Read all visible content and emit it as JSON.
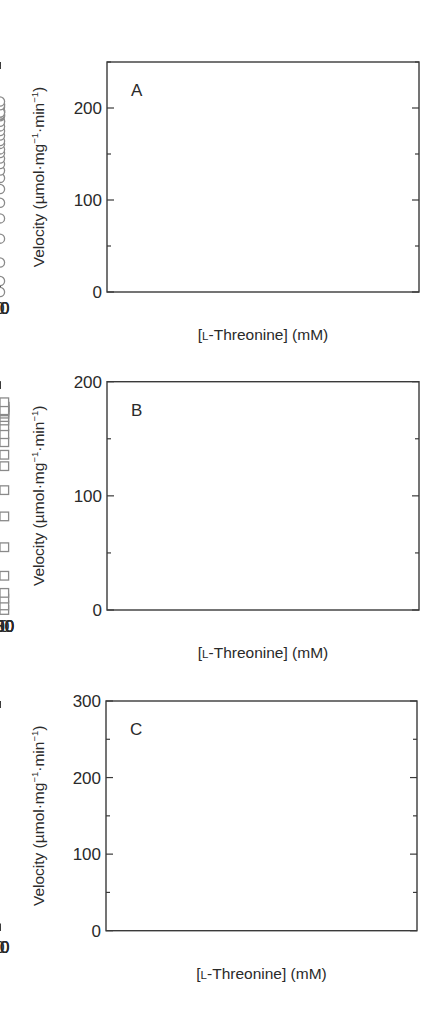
{
  "figure": {
    "marker_stroke_color": "#8a8a8a",
    "fit_line_color": "#7a7a7a",
    "axis_color": "#3a3a3a"
  },
  "chart_data": [
    {
      "type": "scatter",
      "panel_label": "A",
      "title": "",
      "xlabel": "[L-Threonine] (mM)",
      "xlabel_parts": {
        "open": "[",
        "smallcaps": "L",
        "rest": "-Threonine] (mM)"
      },
      "ylabel": "Velocity (µmol·mg⁻¹·min⁻¹)",
      "ylabel_parts": {
        "pre": "Velocity (µmol·mg",
        "sup1": "−1",
        "mid": "·min",
        "sup2": "−1",
        "post": ")"
      },
      "marker": "circle",
      "xlim": [
        0,
        60
      ],
      "ylim": [
        0,
        250
      ],
      "frame_px": {
        "left": 107,
        "top": 62,
        "right": 419,
        "bottom": 292,
        "x0": 107,
        "x_at_ref": 392,
        "x_ref": 60
      },
      "x_major_ticks": [
        0,
        20,
        40,
        60
      ],
      "x_minor_ticks": [
        10,
        30,
        50
      ],
      "y_major_ticks": [
        0,
        100,
        200
      ],
      "y_minor_ticks": [
        50,
        150,
        250
      ],
      "x": [
        0.5,
        2.9,
        4.2,
        5.3,
        6.6,
        7.6,
        8.6,
        9.5,
        10.5,
        11.4,
        12.4,
        13.4,
        14.4,
        16.1,
        18.2,
        19.2,
        20.8,
        22.8,
        24.8,
        27.6,
        30.6,
        33.6,
        36.6,
        39.2,
        40.9,
        42.7,
        45.7,
        48.9,
        50.8,
        51.7,
        54.9,
        60.8
      ],
      "y": [
        0,
        12,
        32,
        58,
        80,
        97,
        112,
        124,
        132,
        139,
        145,
        151,
        155,
        161,
        164,
        170,
        175,
        180,
        186,
        185,
        191,
        192,
        193,
        196,
        197,
        195,
        197,
        201,
        204,
        195,
        203,
        207
      ],
      "fit": {
        "x": [
          0,
          1.5,
          3,
          4,
          5,
          6,
          7,
          8,
          9,
          10,
          12,
          14,
          16,
          18,
          20,
          24,
          28,
          32,
          36,
          40,
          45,
          50,
          55,
          62.5
        ],
        "y": [
          0,
          3,
          14,
          28,
          46,
          66,
          83,
          98,
          110,
          120,
          136,
          148,
          157,
          164,
          170,
          179,
          185,
          189,
          192,
          195,
          197,
          199,
          201,
          203
        ]
      }
    },
    {
      "type": "scatter",
      "panel_label": "B",
      "title": "",
      "xlabel": "[L-Threonine] (mM)",
      "xlabel_parts": {
        "open": "[",
        "smallcaps": "L",
        "rest": "-Threonine] (mM)"
      },
      "ylabel": "Velocity (µmol·mg⁻¹·min⁻¹)",
      "ylabel_parts": {
        "pre": "Velocity (µmol·mg",
        "sup1": "−1",
        "mid": "·min",
        "sup2": "−1",
        "post": ")"
      },
      "marker": "square",
      "xlim": [
        0,
        277
      ],
      "ylim": [
        0,
        200
      ],
      "frame_px": {
        "left": 107,
        "top": 381.7,
        "right": 419,
        "bottom": 610,
        "x0": 107.3,
        "x_at_ref": 388.7,
        "x_ref": 250
      },
      "x_major_ticks": [
        0,
        50,
        100,
        150,
        200,
        250
      ],
      "x_minor_ticks": [
        25,
        75,
        125,
        175,
        225
      ],
      "y_major_ticks": [
        0,
        100,
        200
      ],
      "y_minor_ticks": [
        50,
        150
      ],
      "x": [
        10,
        20,
        30,
        40,
        50,
        60,
        70,
        80,
        90,
        100,
        110,
        120,
        130,
        140,
        150,
        157,
        167,
        177,
        188,
        198,
        208,
        219,
        230,
        240,
        261
      ],
      "y": [
        0,
        4,
        10,
        15,
        30,
        55,
        82,
        105,
        126,
        136,
        147,
        154,
        161,
        166,
        169,
        172,
        174,
        176,
        178,
        175,
        178,
        178,
        178,
        175,
        182
      ],
      "fit": {
        "x": [
          10,
          20,
          30,
          40,
          45,
          50,
          55,
          60,
          65,
          70,
          75,
          80,
          85,
          90,
          100,
          110,
          120,
          130,
          140,
          150,
          170,
          190,
          210,
          230,
          250,
          268
        ],
        "y": [
          0,
          2,
          6,
          13,
          19,
          27,
          40,
          54,
          68,
          82,
          94,
          105,
          115,
          123,
          136,
          146,
          154,
          160,
          165,
          169,
          174,
          177,
          178,
          179,
          180,
          180
        ]
      }
    },
    {
      "type": "scatter",
      "panel_label": "C",
      "title": "",
      "xlabel": "[L-Threonine] (mM)",
      "xlabel_parts": {
        "open": "[",
        "smallcaps": "L",
        "rest": "-Threonine] (mM)"
      },
      "ylabel": "Velocity (µmol·mg⁻¹·min⁻¹)",
      "ylabel_parts": {
        "pre": "Velocity (µmol·mg",
        "sup1": "−1",
        "mid": "·min",
        "sup2": "−1",
        "post": ")"
      },
      "marker": "triangle",
      "xlim": [
        0,
        65.5
      ],
      "ylim": [
        0,
        300
      ],
      "frame_px": {
        "left": 106,
        "top": 701,
        "right": 417,
        "bottom": 930.7,
        "x0": 106,
        "x_at_ref": 391,
        "x_ref": 60
      },
      "x_major_ticks": [
        0,
        20,
        40,
        60
      ],
      "x_minor_ticks": [
        10,
        30,
        50
      ],
      "y_major_ticks": [
        0,
        100,
        200,
        300
      ],
      "y_minor_ticks": [
        50,
        150,
        250
      ],
      "x": [
        0.4,
        1.0,
        1.7,
        2.4,
        3.1,
        3.8,
        4.5,
        5.2,
        6.1,
        7.2,
        8.3,
        9.4,
        10.9,
        12.3,
        14.3,
        16.5,
        18.4,
        20.3,
        23.2,
        26.7,
        30.2,
        34.4,
        38.5,
        40.6,
        42.7,
        50.5
      ],
      "y": [
        17,
        33,
        47,
        61,
        75,
        87,
        95,
        103,
        113,
        120,
        129,
        138,
        145,
        156,
        162,
        170,
        174,
        180,
        182,
        187,
        190,
        193,
        196,
        197,
        198,
        200
      ],
      "fit": {
        "x": [
          0.2,
          0.6,
          1.0,
          1.5,
          2,
          3,
          4,
          5,
          6,
          8,
          10,
          12,
          15,
          18,
          22,
          26,
          30,
          35,
          40,
          45,
          50,
          55,
          60.7
        ],
        "y": [
          10,
          25,
          36,
          48,
          58,
          74,
          87,
          98,
          107,
          121,
          133,
          143,
          155,
          164,
          173,
          180,
          185,
          190,
          194,
          197,
          200,
          202,
          204
        ]
      }
    }
  ]
}
